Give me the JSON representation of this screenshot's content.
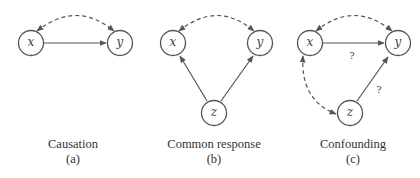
{
  "panels": [
    {
      "id": "a",
      "title": "Causation",
      "label": "(a)",
      "nodes": {
        "x": "x",
        "y": "y"
      },
      "edges": [
        {
          "from": "x",
          "to": "y",
          "style": "solid",
          "label": ""
        },
        {
          "from": "x",
          "to": "y",
          "style": "dashed-curved-bidirectional",
          "label": ""
        }
      ]
    },
    {
      "id": "b",
      "title": "Common response",
      "label": "(b)",
      "nodes": {
        "x": "x",
        "y": "y",
        "z": "z"
      },
      "edges": [
        {
          "from": "z",
          "to": "x",
          "style": "solid",
          "label": ""
        },
        {
          "from": "z",
          "to": "y",
          "style": "solid",
          "label": ""
        },
        {
          "from": "x",
          "to": "y",
          "style": "dashed-curved-bidirectional",
          "label": ""
        }
      ]
    },
    {
      "id": "c",
      "title": "Confounding",
      "label": "(c)",
      "nodes": {
        "x": "x",
        "y": "y",
        "z": "z"
      },
      "edges": [
        {
          "from": "x",
          "to": "y",
          "style": "solid",
          "label": "?"
        },
        {
          "from": "z",
          "to": "y",
          "style": "solid",
          "label": "?"
        },
        {
          "from": "x",
          "to": "y",
          "style": "dashed-curved-bidirectional",
          "label": ""
        },
        {
          "from": "x",
          "to": "z",
          "style": "dashed-curved-bidirectional",
          "label": ""
        }
      ]
    }
  ],
  "colors": {
    "stroke": "#555555",
    "text": "#333333",
    "background": "#ffffff"
  }
}
